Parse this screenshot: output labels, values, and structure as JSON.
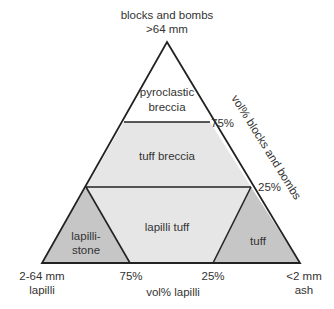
{
  "vertices": {
    "top": {
      "line1": "blocks and bombs",
      "line2": ">64 mm"
    },
    "bottom_left": {
      "line1": "2-64 mm",
      "line2": "lapilli"
    },
    "bottom_right": {
      "line1": "<2 mm",
      "line2": "ash"
    }
  },
  "axes": {
    "right_axis_label": "vol% blocks and bombs",
    "bottom_axis_label": "vol% lapilli",
    "right_ticks": [
      "75%",
      "25%"
    ],
    "bottom_ticks": [
      "75%",
      "25%"
    ]
  },
  "fields": [
    {
      "name": "pyroclastic breccia",
      "line1": "pyroclastic",
      "line2": "breccia",
      "color": "#ffffff"
    },
    {
      "name": "tuff breccia",
      "line1": "tuff breccia",
      "color": "#e6e6e6"
    },
    {
      "name": "lapilli tuff",
      "line1": "lapilli tuff",
      "color": "#e6e6e6"
    },
    {
      "name": "lapillistone",
      "line1": "lapilli-",
      "line2": "stone",
      "color": "#c6c6c6"
    },
    {
      "name": "tuff",
      "line1": "tuff",
      "color": "#c6c6c6"
    }
  ]
}
